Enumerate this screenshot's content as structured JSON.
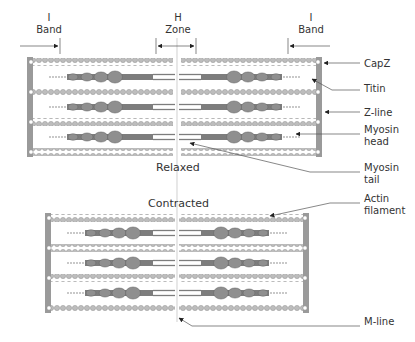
{
  "top_labels": {
    "i_band_left": [
      "I",
      "Band"
    ],
    "h_zone": [
      "H",
      "Zone"
    ],
    "i_band_right": [
      "I",
      "Band"
    ]
  },
  "states": {
    "relaxed": "Relaxed",
    "contracted": "Contracted"
  },
  "callouts": [
    {
      "id": "capz",
      "lines": [
        "CapZ"
      ]
    },
    {
      "id": "titin",
      "lines": [
        "Titin"
      ]
    },
    {
      "id": "z-line",
      "lines": [
        "Z-line"
      ]
    },
    {
      "id": "myosin-head",
      "lines": [
        "Myosin",
        "head"
      ]
    },
    {
      "id": "myosin-tail",
      "lines": [
        "Myosin",
        "tail"
      ]
    },
    {
      "id": "actin-filament",
      "lines": [
        "Actin",
        "filament"
      ]
    },
    {
      "id": "m-line",
      "lines": [
        "M-line"
      ]
    }
  ],
  "colors": {
    "zline": "#9a9a9a",
    "actin": "#b8b8b8",
    "myosin": "#7d7d7d",
    "head": "#8f8f8f",
    "leader": "#555555",
    "text": "#333333"
  }
}
